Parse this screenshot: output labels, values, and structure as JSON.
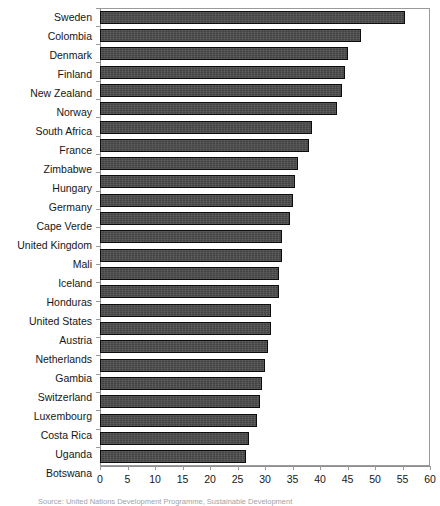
{
  "chart_data": {
    "type": "bar",
    "orientation": "horizontal",
    "title": "",
    "xlabel": "",
    "ylabel": "",
    "xlim": [
      0,
      60
    ],
    "xticks": [
      0,
      5,
      10,
      15,
      20,
      25,
      30,
      35,
      40,
      45,
      50,
      55,
      60
    ],
    "grid": false,
    "legend": null,
    "bar_color": "#4b4b4b",
    "bar_edge_color": "#0d0d0d",
    "categories": [
      "Sweden",
      "Colombia",
      "Denmark",
      "Finland",
      "New Zealand",
      "Norway",
      "South Africa",
      "France",
      "Zimbabwe",
      "Hungary",
      "Germany",
      "Cape Verde",
      "United Kingdom",
      "Mali",
      "Iceland",
      "Honduras",
      "United States",
      "Austria",
      "Netherlands",
      "Gambia",
      "Switzerland",
      "Luxembourg",
      "Costa Rica",
      "Uganda",
      "Botswana"
    ],
    "values": [
      55.5,
      47.5,
      45.0,
      44.5,
      44.0,
      43.0,
      38.5,
      38.0,
      36.0,
      35.5,
      35.0,
      34.5,
      33.0,
      33.0,
      32.5,
      32.5,
      31.0,
      31.0,
      30.5,
      30.0,
      29.5,
      29.0,
      28.5,
      27.0,
      26.5
    ]
  },
  "caption": {
    "source_text": "Source: United Nations Development Programme, Sustainable Development"
  }
}
